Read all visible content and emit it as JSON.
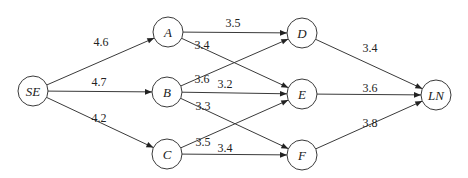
{
  "diagram": {
    "type": "directed-weighted-network",
    "nodes": [
      {
        "id": "SE",
        "label": "SE",
        "x": 33,
        "y": 91
      },
      {
        "id": "A",
        "label": "A",
        "x": 168,
        "y": 32
      },
      {
        "id": "B",
        "label": "B",
        "x": 167,
        "y": 92
      },
      {
        "id": "C",
        "label": "C",
        "x": 167,
        "y": 154
      },
      {
        "id": "D",
        "label": "D",
        "x": 302,
        "y": 33
      },
      {
        "id": "E",
        "label": "E",
        "x": 302,
        "y": 94
      },
      {
        "id": "F",
        "label": "F",
        "x": 302,
        "y": 155
      },
      {
        "id": "LN",
        "label": "LN",
        "x": 436,
        "y": 95
      }
    ],
    "edges": [
      {
        "from": "SE",
        "to": "A",
        "weight": "4.6",
        "lx": 101,
        "ly": 46
      },
      {
        "from": "SE",
        "to": "B",
        "weight": "4.7",
        "lx": 99,
        "ly": 86
      },
      {
        "from": "SE",
        "to": "C",
        "weight": "4.2",
        "lx": 99,
        "ly": 122
      },
      {
        "from": "A",
        "to": "D",
        "weight": "3.5",
        "lx": 233,
        "ly": 27
      },
      {
        "from": "A",
        "to": "E",
        "weight": "3.4",
        "lx": 202,
        "ly": 49
      },
      {
        "from": "B",
        "to": "D",
        "weight": "3.6",
        "lx": 202,
        "ly": 83
      },
      {
        "from": "B",
        "to": "E",
        "weight": "3.2",
        "lx": 225,
        "ly": 88
      },
      {
        "from": "B",
        "to": "F",
        "weight": "3.3",
        "lx": 203,
        "ly": 110
      },
      {
        "from": "C",
        "to": "E",
        "weight": "3.5",
        "lx": 203,
        "ly": 146
      },
      {
        "from": "C",
        "to": "F",
        "weight": "3.4",
        "lx": 225,
        "ly": 152
      },
      {
        "from": "D",
        "to": "LN",
        "weight": "3.4",
        "lx": 370,
        "ly": 52
      },
      {
        "from": "E",
        "to": "LN",
        "weight": "3.6",
        "lx": 370,
        "ly": 92
      },
      {
        "from": "F",
        "to": "LN",
        "weight": "3.8",
        "lx": 370,
        "ly": 127
      }
    ],
    "node_radius": 15
  }
}
